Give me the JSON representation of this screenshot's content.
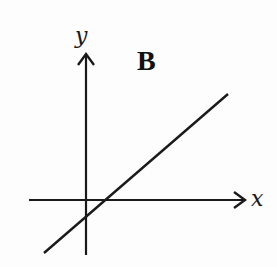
{
  "diagram": {
    "panel_label": "B",
    "x_axis_label": "x",
    "y_axis_label": "y",
    "colors": {
      "ink": "#1a1a1a",
      "background": "#fdfdfd"
    },
    "elements": {
      "x_axis": {
        "x1": 29,
        "y1": 200,
        "x2": 246,
        "y2": 200,
        "arrow": "right"
      },
      "y_axis": {
        "x1": 86,
        "y1": 255,
        "x2": 86,
        "y2": 53,
        "arrow": "up"
      },
      "line": {
        "x1": 44,
        "y1": 253,
        "x2": 228,
        "y2": 94,
        "description": "straight line with positive slope and negative y-intercept"
      }
    }
  }
}
